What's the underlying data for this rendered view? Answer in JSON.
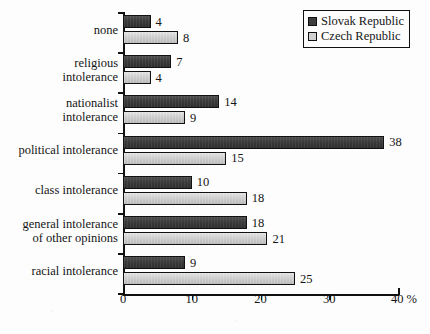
{
  "chart_data": {
    "type": "bar",
    "orientation": "horizontal",
    "title": "",
    "xlabel": "",
    "ylabel": "",
    "xlim": [
      0,
      40
    ],
    "xticks": [
      0,
      10,
      20,
      30,
      40
    ],
    "xtick_labels": [
      "0",
      "10",
      "20",
      "30",
      "40 %"
    ],
    "unit": "%",
    "grid": false,
    "legend_position": "top-right",
    "categories": [
      "none",
      "religious\nintolerance",
      "nationalist\nintolerance",
      "political intolerance",
      "class intolerance",
      "general intolerance\nof other opinions",
      "racial intolerance"
    ],
    "series": [
      {
        "name": "Slovak Republic",
        "color": "#3d3d3d",
        "values": [
          4,
          7,
          14,
          38,
          10,
          18,
          9
        ]
      },
      {
        "name": "Czech Republic",
        "color": "#d0d0d0",
        "values": [
          8,
          4,
          9,
          15,
          18,
          21,
          25
        ]
      }
    ]
  },
  "legend": {
    "items": [
      {
        "label": "Slovak Republic",
        "swatch": "dark"
      },
      {
        "label": "Czech Republic",
        "swatch": "light"
      }
    ]
  },
  "colors": {
    "bar_dark": "#3d3d3d",
    "bar_light": "#d0d0d0",
    "axis": "#111111",
    "background": "#fdfdfd"
  }
}
